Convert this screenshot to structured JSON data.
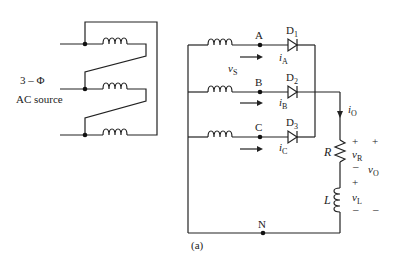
{
  "source": {
    "label_line1": "3 – Φ",
    "label_line2": "AC source"
  },
  "nodes": {
    "A": "A",
    "B": "B",
    "C": "C",
    "N": "N"
  },
  "diodes": {
    "d1": {
      "main": "D",
      "sub": "1"
    },
    "d2": {
      "main": "D",
      "sub": "2"
    },
    "d3": {
      "main": "D",
      "sub": "3"
    }
  },
  "currents": {
    "iA": {
      "main": "i",
      "sub": "A"
    },
    "iB": {
      "main": "i",
      "sub": "B"
    },
    "iC": {
      "main": "i",
      "sub": "C"
    },
    "iO": {
      "main": "i",
      "sub": "O"
    }
  },
  "voltages": {
    "vS": {
      "main": "v",
      "sub": "S"
    },
    "vR": {
      "main": "v",
      "sub": "R"
    },
    "vL": {
      "main": "v",
      "sub": "L"
    },
    "vO": {
      "main": "v",
      "sub": "O"
    }
  },
  "components": {
    "R": "R",
    "L": "L"
  },
  "polarity": {
    "plus": "+",
    "minus": "–"
  },
  "caption": "(a)"
}
